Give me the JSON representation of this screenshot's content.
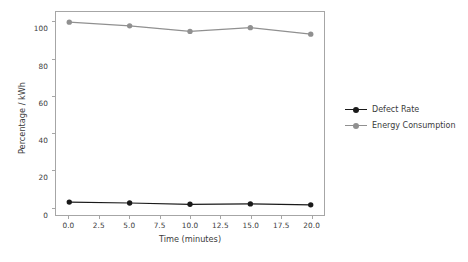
{
  "chart_data": {
    "type": "line",
    "title": "",
    "xlabel": "Time (minutes)",
    "ylabel": "Percentage / kWh",
    "x": [
      0,
      5,
      10,
      15,
      20
    ],
    "xlim": [
      -1.1,
      21.1
    ],
    "ylim": [
      -4.5,
      105.5
    ],
    "xticks": [
      0,
      2.5,
      5,
      7.5,
      10,
      12.5,
      15,
      17.5,
      20
    ],
    "xtick_labels": [
      "0.0",
      "2.5",
      "5.0",
      "7.5",
      "10.0",
      "12.5",
      "15.0",
      "17.5",
      "20.0"
    ],
    "yticks": [
      0,
      20,
      40,
      60,
      80,
      100
    ],
    "ytick_labels": [
      "0",
      "20",
      "40",
      "60",
      "80",
      "100"
    ],
    "grid": false,
    "legend_position": "right-outside",
    "series": [
      {
        "name": "Defect Rate",
        "values": [
          2.5,
          2.0,
          1.3,
          1.5,
          1.0
        ],
        "color": "#1a1a1a",
        "marker": "circle"
      },
      {
        "name": "Energy Consumption",
        "values": [
          100.0,
          98.0,
          95.0,
          97.0,
          93.5
        ],
        "color": "#909090",
        "marker": "circle"
      }
    ]
  },
  "axes": {
    "spine_color": "#a6a6a6",
    "tick_color": "#3b3b3b"
  }
}
